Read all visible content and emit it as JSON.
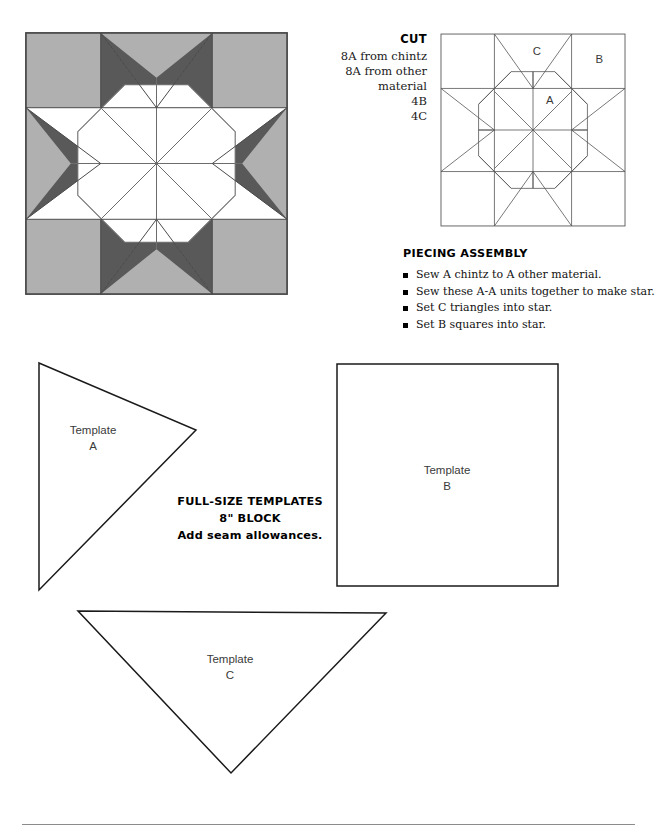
{
  "document": {
    "type": "quilt-pattern-sheet"
  },
  "colors": {
    "light_gray": "#b0b0b0",
    "dark_gray": "#595959",
    "white": "#ffffff",
    "outline": "#333333",
    "seam_line": "#6b6b6b",
    "rule": "#8c8c8c"
  },
  "quilt_block": {
    "name": "eight-pointed-star-block",
    "star_points": 8,
    "center_shape": "octagon",
    "center_divisions": 8,
    "corner_squares": 4,
    "side_triangles": 4
  },
  "cut": {
    "heading": "CUT",
    "lines": [
      "8A from chintz",
      "8A from other material",
      "4B",
      "4C"
    ]
  },
  "line_diagram": {
    "name": "block-piecing-diagram",
    "labels": {
      "a": "A",
      "b": "B",
      "c": "C"
    }
  },
  "piecing": {
    "heading": "PIECING ASSEMBLY",
    "steps": [
      "Sew A chintz to A other material.",
      "Sew these A-A units together to make star.",
      "Set C triangles into star.",
      "Set B squares into star."
    ]
  },
  "templates": {
    "caption": {
      "line1": "FULL-SIZE TEMPLATES",
      "line2": "8\" BLOCK",
      "line3": "Add seam allowances."
    },
    "a": {
      "label_line1": "Template",
      "label_line2": "A",
      "shape": "triangle-pointing-right"
    },
    "b": {
      "label_line1": "Template",
      "label_line2": "B",
      "shape": "square"
    },
    "c": {
      "label_line1": "Template",
      "label_line2": "C",
      "shape": "triangle-pointing-down"
    }
  }
}
